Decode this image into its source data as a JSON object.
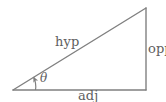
{
  "figure": {
    "name": "right-triangle-trigonometry-diagram",
    "background_color": "#ffffff",
    "stroke_color": "#808080",
    "text_color": "#5e5e5e",
    "width": 166,
    "height": 102
  },
  "labels": {
    "hypotenuse": "hyp",
    "opposite": "opp",
    "adjacent": "adj",
    "angle": "θ"
  },
  "geometry": {
    "vertex_angle": [
      13,
      90
    ],
    "vertex_apex": [
      146,
      8
    ],
    "vertex_right": [
      146,
      90
    ],
    "angle_arc_radius": 22
  }
}
